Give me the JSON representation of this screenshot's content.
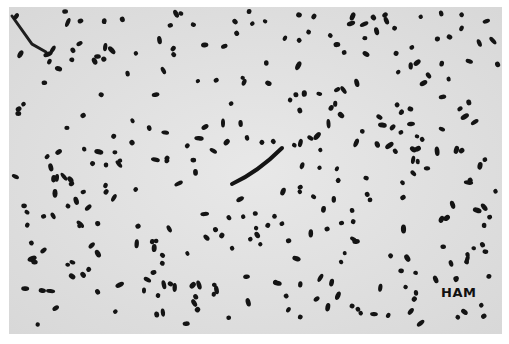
{
  "image": {
    "description": "Black-and-white micrograph of stained bacterial cells (short rods / cocci) scattered on a light grey background",
    "label": "HAM",
    "colors": {
      "background": "#e4e4e4",
      "cells": "#141414",
      "border": "#ffffff"
    }
  }
}
